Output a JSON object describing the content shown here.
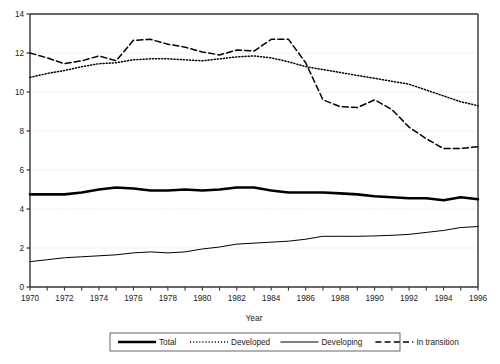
{
  "chart_data": {
    "type": "line",
    "title": "",
    "xlabel": "Year",
    "ylabel": "",
    "xlim": [
      1970,
      1996
    ],
    "ylim": [
      0,
      14
    ],
    "ytick_step": 2,
    "yticks": [
      0,
      2,
      4,
      6,
      8,
      10,
      12,
      14
    ],
    "ytick_labels": [
      "0",
      "2",
      "4",
      "6",
      "8",
      "10",
      "12",
      "14"
    ],
    "xticks": [
      1970,
      1971,
      1972,
      1973,
      1974,
      1975,
      1976,
      1977,
      1978,
      1979,
      1980,
      1981,
      1982,
      1983,
      1984,
      1985,
      1986,
      1987,
      1988,
      1989,
      1990,
      1991,
      1992,
      1993,
      1994,
      1995,
      1996
    ],
    "xtick_labels_shown": [
      "1970",
      "1972",
      "1974",
      "1976",
      "1978",
      "1980",
      "1982",
      "1984",
      "1986",
      "1988",
      "1990",
      "1992",
      "1994",
      "1996"
    ],
    "xtick_label_step": 2,
    "grid": true,
    "grid_axis": "y",
    "legend_position": "bottom",
    "x": [
      1970,
      1971,
      1972,
      1973,
      1974,
      1975,
      1976,
      1977,
      1978,
      1979,
      1980,
      1981,
      1982,
      1983,
      1984,
      1985,
      1986,
      1987,
      1988,
      1989,
      1990,
      1991,
      1992,
      1993,
      1994,
      1995,
      1996
    ],
    "series": [
      {
        "name": "Total",
        "style": "thick-solid",
        "color": "#000000",
        "values": [
          4.75,
          4.75,
          4.75,
          4.85,
          5.0,
          5.1,
          5.05,
          4.95,
          4.95,
          5.0,
          4.95,
          5.0,
          5.1,
          5.1,
          4.95,
          4.85,
          4.85,
          4.85,
          4.8,
          4.75,
          4.65,
          4.6,
          4.55,
          4.55,
          4.45,
          4.6,
          4.5
        ]
      },
      {
        "name": "Developed",
        "style": "dotted",
        "color": "#000000",
        "values": [
          10.75,
          10.95,
          11.1,
          11.3,
          11.45,
          11.5,
          11.65,
          11.7,
          11.7,
          11.65,
          11.6,
          11.7,
          11.8,
          11.85,
          11.75,
          11.55,
          11.3,
          11.15,
          11.0,
          10.85,
          10.7,
          10.55,
          10.4,
          10.1,
          9.8,
          9.5,
          9.3
        ]
      },
      {
        "name": "Developing",
        "style": "thin-solid",
        "color": "#000000",
        "values": [
          1.3,
          1.4,
          1.5,
          1.55,
          1.6,
          1.65,
          1.75,
          1.8,
          1.75,
          1.8,
          1.95,
          2.05,
          2.2,
          2.25,
          2.3,
          2.35,
          2.45,
          2.6,
          2.6,
          2.6,
          2.62,
          2.65,
          2.7,
          2.8,
          2.9,
          3.05,
          3.1
        ]
      },
      {
        "name": "In transition",
        "style": "dashed",
        "color": "#000000",
        "values": [
          12.0,
          11.75,
          11.45,
          11.6,
          11.85,
          11.6,
          12.65,
          12.7,
          12.45,
          12.3,
          12.05,
          11.9,
          12.15,
          12.1,
          12.7,
          12.7,
          11.5,
          9.6,
          9.25,
          9.2,
          9.6,
          9.1,
          8.2,
          7.6,
          7.1,
          7.1,
          7.2
        ]
      }
    ]
  },
  "axis": {
    "x_title": "Year"
  },
  "legend": {
    "items": [
      {
        "label": "Total",
        "style": "thick-solid"
      },
      {
        "label": "Developed",
        "style": "dotted"
      },
      {
        "label": "Developing",
        "style": "thin-solid"
      },
      {
        "label": "In transition",
        "style": "dashed"
      }
    ]
  },
  "colors": {
    "line": "#000000",
    "grid": "#d8d8d8",
    "frame": "#333333",
    "text": "#1a1a1a",
    "background": "#ffffff"
  }
}
